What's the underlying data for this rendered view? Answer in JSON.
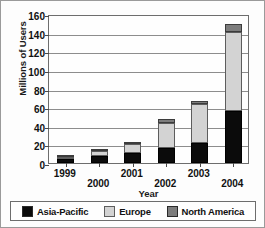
{
  "chart_data": {
    "type": "bar",
    "subtype": "stacked-vertical",
    "title": "",
    "xlabel": "Year",
    "ylabel": "Millions of Users",
    "categories": [
      "1999",
      "2000",
      "2001",
      "2002",
      "2003",
      "2004"
    ],
    "series": [
      {
        "name": "Asia-Pacific",
        "color": "#0b0b0b",
        "values": [
          4,
          8,
          11,
          16,
          21,
          56
        ]
      },
      {
        "name": "Europe",
        "color": "#d3d3d3",
        "values": [
          3,
          5,
          9,
          27,
          42,
          85
        ]
      },
      {
        "name": "North America",
        "color": "#7d7d7d",
        "values": [
          2,
          2,
          3,
          4,
          4,
          8
        ]
      }
    ],
    "totals": [
      9,
      15,
      23,
      47,
      67,
      149
    ],
    "ylim": [
      0,
      160
    ],
    "yticks": [
      0,
      20,
      40,
      60,
      80,
      100,
      120,
      140,
      160
    ],
    "ytick_labels": [
      "0",
      "20",
      "40",
      "60",
      "80",
      "100",
      "120",
      "140",
      "160"
    ],
    "grid": true,
    "grid_axis": "y",
    "legend_position": "bottom"
  },
  "legend": {
    "entries": [
      {
        "label": "Asia-Pacific",
        "swatch": "#0b0b0b"
      },
      {
        "label": "Europe",
        "swatch": "#d3d3d3"
      },
      {
        "label": "North America",
        "swatch": "#7d7d7d"
      }
    ]
  }
}
